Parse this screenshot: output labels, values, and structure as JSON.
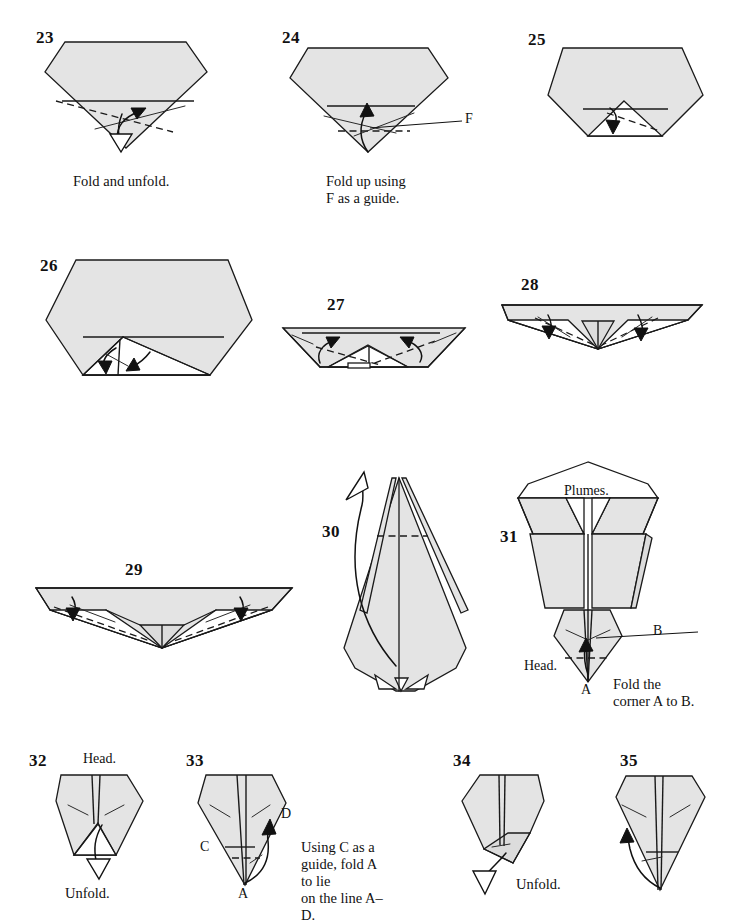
{
  "document": {
    "kind": "origami-instruction-diagram",
    "page_background": "#ffffff",
    "paper_fill": "#e4e4e4",
    "line_color": "#1a1a1a",
    "step_range": "23-35"
  },
  "steps": [
    {
      "number": "23",
      "caption": "Fold and unfold.",
      "labels": []
    },
    {
      "number": "24",
      "caption": "Fold up using\nF as a guide.",
      "labels": [
        "F"
      ]
    },
    {
      "number": "25",
      "caption": "",
      "labels": []
    },
    {
      "number": "26",
      "caption": "",
      "labels": []
    },
    {
      "number": "27",
      "caption": "",
      "labels": []
    },
    {
      "number": "28",
      "caption": "",
      "labels": []
    },
    {
      "number": "29",
      "caption": "",
      "labels": []
    },
    {
      "number": "30",
      "caption": "",
      "labels": []
    },
    {
      "number": "31",
      "caption": "Fold the\ncorner A to B.",
      "labels": [
        "Plumes.",
        "B",
        "Head.",
        "A"
      ]
    },
    {
      "number": "32",
      "caption": "Unfold.",
      "labels": [
        "Head."
      ]
    },
    {
      "number": "33",
      "caption": "Using C as a\nguide, fold A to lie\non the line A–D.",
      "labels": [
        "D",
        "C",
        "A"
      ]
    },
    {
      "number": "34",
      "caption": "Unfold.",
      "labels": []
    },
    {
      "number": "35",
      "caption": "",
      "labels": []
    }
  ],
  "text": {
    "s23_number": "23",
    "s23_caption": "Fold and unfold.",
    "s24_number": "24",
    "s24_caption": "Fold up using\nF as a guide.",
    "s24_label_F": "F",
    "s25_number": "25",
    "s26_number": "26",
    "s27_number": "27",
    "s28_number": "28",
    "s29_number": "29",
    "s30_number": "30",
    "s31_number": "31",
    "s31_plumes": "Plumes.",
    "s31_label_B": "B",
    "s31_head": "Head.",
    "s31_label_A": "A",
    "s31_caption": "Fold the\ncorner A to B.",
    "s32_number": "32",
    "s32_head": "Head.",
    "s32_caption": "Unfold.",
    "s33_number": "33",
    "s33_label_D": "D",
    "s33_label_C": "C",
    "s33_label_A": "A",
    "s33_caption": "Using C as a\nguide, fold A to lie\non the line A–D.",
    "s34_number": "34",
    "s34_caption": "Unfold.",
    "s35_number": "35"
  }
}
